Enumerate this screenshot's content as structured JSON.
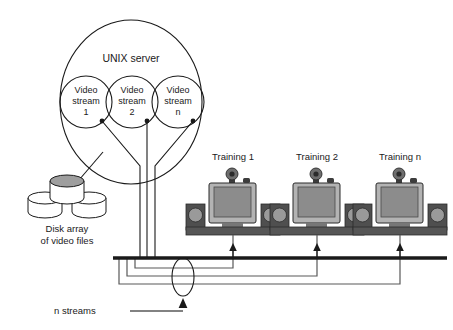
{
  "diagram": {
    "title_text": "Video streaming network diagram",
    "type": "network-topology",
    "server": {
      "label": "UNIX server",
      "shape": "ellipse",
      "streams": [
        {
          "line1": "Video",
          "line2": "stream",
          "line3": "1"
        },
        {
          "line1": "Video",
          "line2": "stream",
          "line3": "2"
        },
        {
          "line1": "Video",
          "line2": "stream",
          "line3": "n"
        }
      ]
    },
    "storage": {
      "label_line1": "Disk array",
      "label_line2": "of video files",
      "disk_count": 3
    },
    "workstations": [
      {
        "label": "Training 1"
      },
      {
        "label": "Training 2"
      },
      {
        "label": "Training n"
      }
    ],
    "network": {
      "bus_label": "",
      "stream_flow_label": "n streams"
    },
    "colors": {
      "stroke": "#1a1a1a",
      "background": "#ffffff",
      "bus": "#1a1a1a",
      "screen_gray": "#8c8c8c",
      "bezel_gray": "#b3b3b3",
      "case_dark": "#565656",
      "speaker_dark": "#4f4f4f",
      "speaker_driver": "#9a9a9a",
      "disk_top": "#9e9e9e",
      "disk_body": "#ffffff",
      "text": "#1a1a1a"
    }
  }
}
